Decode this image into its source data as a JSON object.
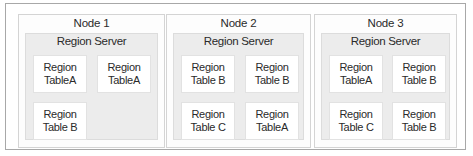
{
  "diagram": {
    "nodes": [
      {
        "title": "Node 1",
        "server": "Region Server",
        "regions": [
          {
            "line1": "Region",
            "line2": "TableA"
          },
          {
            "line1": "Region",
            "line2": "TableA"
          },
          {
            "line1": "Region",
            "line2": "Table B"
          }
        ]
      },
      {
        "title": "Node 2",
        "server": "Region Server",
        "regions": [
          {
            "line1": "Region",
            "line2": "Table B"
          },
          {
            "line1": "Region",
            "line2": "Table B"
          },
          {
            "line1": "Region",
            "line2": "Table C"
          },
          {
            "line1": "Region",
            "line2": "TableA"
          }
        ]
      },
      {
        "title": "Node 3",
        "server": "Region Server",
        "regions": [
          {
            "line1": "Region",
            "line2": "TableA"
          },
          {
            "line1": "Region",
            "line2": "Table B"
          },
          {
            "line1": "Region",
            "line2": "Table C"
          },
          {
            "line1": "Region",
            "line2": "Table B"
          }
        ]
      }
    ]
  }
}
